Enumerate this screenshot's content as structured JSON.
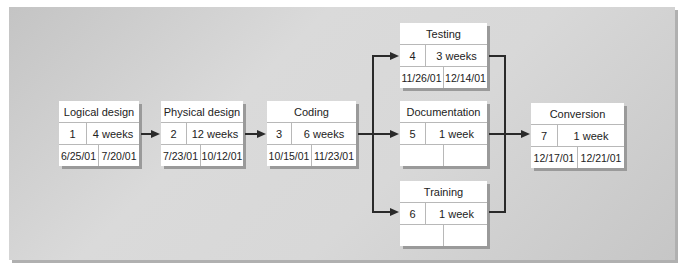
{
  "diagram": {
    "type": "PERT chart",
    "tasks": [
      {
        "id": "1",
        "name": "Logical design",
        "duration": "4 weeks",
        "start": "6/25/01",
        "end": "7/20/01"
      },
      {
        "id": "2",
        "name": "Physical design",
        "duration": "12 weeks",
        "start": "7/23/01",
        "end": "10/12/01"
      },
      {
        "id": "3",
        "name": "Coding",
        "duration": "6 weeks",
        "start": "10/15/01",
        "end": "11/23/01"
      },
      {
        "id": "4",
        "name": "Testing",
        "duration": "3 weeks",
        "start": "11/26/01",
        "end": "12/14/01"
      },
      {
        "id": "5",
        "name": "Documentation",
        "duration": "1 week",
        "start": "",
        "end": ""
      },
      {
        "id": "6",
        "name": "Training",
        "duration": "1 week",
        "start": "",
        "end": ""
      },
      {
        "id": "7",
        "name": "Conversion",
        "duration": "1 week",
        "start": "12/17/01",
        "end": "12/21/01"
      }
    ],
    "edges": [
      [
        "1",
        "2"
      ],
      [
        "2",
        "3"
      ],
      [
        "3",
        "4"
      ],
      [
        "3",
        "5"
      ],
      [
        "3",
        "6"
      ],
      [
        "4",
        "7"
      ],
      [
        "5",
        "7"
      ],
      [
        "6",
        "7"
      ]
    ]
  }
}
